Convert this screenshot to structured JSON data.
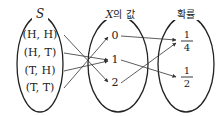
{
  "sets": {
    "sample_space": {
      "label": "S",
      "elements": [
        "(H, H)",
        "(H, T)",
        "(T, H)",
        "(T, T)"
      ]
    },
    "x_values": {
      "label_var": "X",
      "label_suffix": "의 값",
      "elements": [
        "0",
        "1",
        "2"
      ]
    },
    "probabilities": {
      "label": "확률",
      "elements": [
        {
          "num": "1",
          "den": "4"
        },
        {
          "num": "1",
          "den": "2"
        }
      ]
    }
  },
  "mappings": {
    "sample_to_x": [
      [
        "(H, H)",
        "2"
      ],
      [
        "(H, T)",
        "1"
      ],
      [
        "(T, H)",
        "1"
      ],
      [
        "(T, T)",
        "0"
      ]
    ],
    "x_to_prob": [
      [
        "0",
        "1/4"
      ],
      [
        "1",
        "1/2"
      ],
      [
        "2",
        "1/4"
      ]
    ]
  }
}
